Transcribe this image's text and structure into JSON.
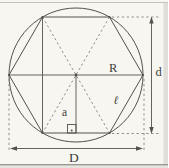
{
  "figure": {
    "labels": {
      "radius": "R",
      "height": "d",
      "side": "ℓ",
      "apothem": "a",
      "diameter": "D"
    },
    "colors": {
      "background": "#f7f6f1",
      "line": "#52524c",
      "dashed": "#83837a",
      "frame": "#c6c5bc",
      "page_edge": "#d7d6d0"
    }
  }
}
